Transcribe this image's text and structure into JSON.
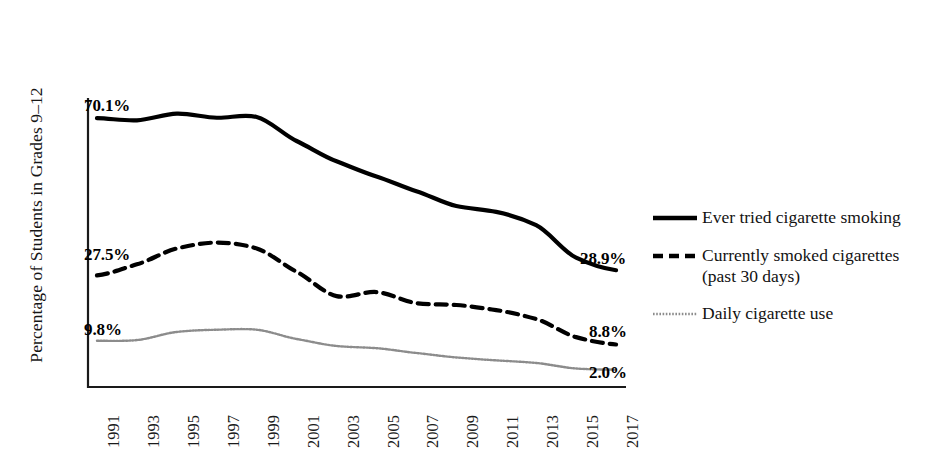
{
  "chart_data": {
    "type": "line",
    "title": "",
    "subtitle": "",
    "xlabel": "",
    "ylabel": "Percentage of Students in Grades 9–12",
    "grid": false,
    "legend_position": "right",
    "xlim": [
      1991,
      2017
    ],
    "ylim": [
      0,
      75
    ],
    "categories": [
      "1991",
      "1993",
      "1995",
      "1997",
      "1999",
      "2001",
      "2003",
      "2005",
      "2007",
      "2009",
      "2011",
      "2013",
      "2015",
      "2017"
    ],
    "x": [
      1991,
      1993,
      1995,
      1997,
      1999,
      2001,
      2003,
      2005,
      2007,
      2009,
      2011,
      2013,
      2015,
      2017
    ],
    "series": [
      {
        "name": "Ever tried cigarette smoking",
        "style": "solid",
        "color": "#000000",
        "width": 4.2,
        "values": [
          70.1,
          69.5,
          71.3,
          70.2,
          70.4,
          63.9,
          58.4,
          54.3,
          50.3,
          46.3,
          44.7,
          41.1,
          32.3,
          28.9
        ],
        "start_label": "70.1%",
        "end_label": "28.9%"
      },
      {
        "name": "Currently smoked cigarettes (past 30 days)",
        "style": "dashed",
        "color": "#000000",
        "width": 4.2,
        "values": [
          27.5,
          30.5,
          34.8,
          36.4,
          34.8,
          28.5,
          21.9,
          23.0,
          20.0,
          19.5,
          18.1,
          15.7,
          10.8,
          8.8
        ],
        "start_label": "27.5%",
        "end_label": "8.8%"
      },
      {
        "name": "Daily cigarette use",
        "style": "dotted",
        "color": "#8c8c8c",
        "width": 2.4,
        "values": [
          9.8,
          10.0,
          12.2,
          12.8,
          12.8,
          10.3,
          8.4,
          7.8,
          6.5,
          5.3,
          4.5,
          3.8,
          2.3,
          2.0
        ],
        "start_label": "9.8%",
        "end_label": "2.0%"
      }
    ],
    "annotations": [
      {
        "text": "70.1%",
        "series": "Ever tried cigarette smoking",
        "position": "start"
      },
      {
        "text": "28.9%",
        "series": "Ever tried cigarette smoking",
        "position": "end"
      },
      {
        "text": "27.5%",
        "series": "Currently smoked cigarettes (past 30 days)",
        "position": "start"
      },
      {
        "text": "8.8%",
        "series": "Currently smoked cigarettes (past 30 days)",
        "position": "end"
      },
      {
        "text": "9.8%",
        "series": "Daily cigarette use",
        "position": "start"
      },
      {
        "text": "2.0%",
        "series": "Daily cigarette use",
        "position": "end"
      }
    ]
  },
  "axis": {
    "ylabel": "Percentage of Students in Grades 9–12",
    "ticks": [
      "1991",
      "1993",
      "1995",
      "1997",
      "1999",
      "2001",
      "2003",
      "2005",
      "2007",
      "2009",
      "2011",
      "2013",
      "2015",
      "2017"
    ]
  },
  "labels": {
    "solid_start": "70.1%",
    "solid_end": "28.9%",
    "dashed_start": "27.5%",
    "dashed_end": "8.8%",
    "dotted_start": "9.8%",
    "dotted_end": "2.0%"
  },
  "legend": {
    "items": [
      {
        "label": "Ever tried cigarette smoking",
        "style": "solid",
        "color": "#000000"
      },
      {
        "label": "Currently smoked cigarettes (past 30 days)",
        "style": "dashed",
        "color": "#000000"
      },
      {
        "label": "Daily cigarette use",
        "style": "dotted",
        "color": "#8c8c8c"
      }
    ]
  }
}
